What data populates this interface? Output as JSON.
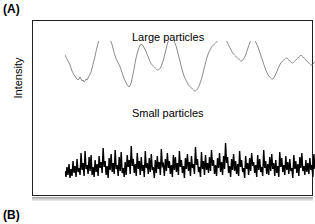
{
  "figure": {
    "panels": [
      {
        "id": "A",
        "label": "(A)"
      },
      {
        "id": "B",
        "label": "(B)"
      }
    ],
    "axis": {
      "ylabel": "Intensity"
    },
    "traces": {
      "large": {
        "label": "Large particles",
        "color": "#6e6e6e"
      },
      "small": {
        "label": "Small particles",
        "color": "#000000"
      }
    },
    "frame": {
      "color": "#231f20"
    }
  },
  "chart_data": {
    "type": "line",
    "title": "",
    "xlabel": "",
    "ylabel": "Intensity",
    "grid": false,
    "legend": "inline-annotation",
    "axis_ticks": {
      "x": [],
      "y": []
    },
    "xlim": [
      0,
      281
    ],
    "ylim": [
      0,
      176
    ],
    "series": [
      {
        "name": "Large particles",
        "color": "#6e6e6e",
        "linewidth": 0.8,
        "baseline_y": 60,
        "description": "Slow quasi-periodic oscillation, four broad maxima",
        "values": [
          46,
          44,
          42,
          40,
          38,
          36,
          33,
          30,
          28,
          26,
          25,
          23,
          22,
          21,
          22,
          24,
          22,
          20,
          21,
          19,
          20,
          22,
          21,
          23,
          25,
          27,
          29,
          33,
          37,
          41,
          45,
          50,
          54,
          58,
          61,
          63,
          62,
          64,
          63,
          65,
          64,
          63,
          62,
          64,
          63,
          61,
          59,
          56,
          52,
          48,
          45,
          42,
          40,
          38,
          36,
          34,
          31,
          28,
          25,
          22,
          20,
          18,
          16,
          15,
          14,
          16,
          18,
          23,
          28,
          33,
          39,
          44,
          48,
          51,
          54,
          56,
          57,
          56,
          55,
          53,
          51,
          49,
          46,
          44,
          41,
          39,
          37,
          36,
          35,
          34,
          33,
          32,
          31,
          31,
          32,
          33,
          35,
          38,
          41,
          45,
          49,
          53,
          57,
          60,
          62,
          63,
          62,
          60,
          61,
          59,
          57,
          54,
          50,
          46,
          42,
          38,
          34,
          30,
          27,
          24,
          22,
          20,
          18,
          16,
          15,
          14,
          13,
          12,
          11,
          10,
          10,
          11,
          12,
          14,
          16,
          19,
          22,
          26,
          30,
          34,
          38,
          42,
          45,
          48,
          50,
          52,
          54,
          55,
          56,
          57,
          58,
          59,
          60,
          62,
          63,
          65,
          66,
          64,
          62,
          63,
          61,
          60,
          58,
          56,
          54,
          52,
          50,
          48,
          47,
          46,
          45,
          44,
          43,
          42,
          41,
          40,
          40,
          41,
          42,
          44,
          46,
          49,
          52,
          55,
          58,
          60,
          62,
          63,
          62,
          61,
          59,
          57,
          55,
          52,
          49,
          46,
          43,
          40,
          37,
          34,
          31,
          29,
          27,
          25,
          24,
          23,
          22,
          22,
          23,
          25,
          27,
          29,
          32,
          34,
          36,
          38,
          39,
          40,
          41,
          42,
          43,
          43,
          42,
          41,
          40,
          39,
          38,
          38,
          39,
          40,
          41,
          42,
          43,
          44,
          45,
          46,
          45,
          44,
          43,
          42,
          41,
          40,
          39,
          38,
          37,
          36,
          36,
          37,
          38,
          39,
          40,
          41,
          42,
          43,
          44,
          45,
          46,
          45,
          44,
          43,
          42,
          41,
          41,
          42,
          43,
          44,
          45,
          46,
          47,
          48,
          49,
          50,
          49,
          48,
          47,
          46,
          45,
          45,
          46,
          47,
          48
        ]
      },
      {
        "name": "Small particles",
        "color": "#000000",
        "linewidth": 1.4,
        "baseline_y": 140,
        "description": "High-frequency noise, rapid spikes of varying amplitude",
        "values": [
          10,
          4,
          14,
          6,
          17,
          3,
          12,
          5,
          20,
          8,
          15,
          4,
          22,
          9,
          13,
          6,
          28,
          11,
          18,
          5,
          30,
          12,
          16,
          7,
          24,
          10,
          26,
          6,
          14,
          4,
          21,
          9,
          17,
          5,
          25,
          13,
          19,
          8,
          33,
          14,
          20,
          6,
          15,
          3,
          23,
          11,
          27,
          9,
          18,
          7,
          31,
          12,
          16,
          5,
          24,
          10,
          29,
          8,
          13,
          4,
          19,
          6,
          26,
          14,
          21,
          7,
          35,
          15,
          22,
          8,
          17,
          5,
          28,
          12,
          20,
          6,
          24,
          10,
          16,
          4,
          30,
          13,
          18,
          7,
          23,
          9,
          27,
          11,
          14,
          3,
          21,
          8,
          25,
          12,
          19,
          6,
          32,
          15,
          17,
          5,
          22,
          10,
          28,
          13,
          20,
          7,
          16,
          4,
          26,
          11,
          24,
          9,
          18,
          6,
          30,
          14,
          21,
          8,
          15,
          3,
          23,
          12,
          27,
          10,
          19,
          5,
          25,
          13,
          17,
          7,
          34,
          16,
          22,
          9,
          14,
          4,
          29,
          12,
          20,
          6,
          26,
          11,
          18,
          8,
          24,
          10,
          31,
          15,
          21,
          7,
          16,
          5,
          23,
          13,
          28,
          9,
          19,
          6,
          25,
          12,
          38,
          18,
          24,
          8,
          15,
          4,
          22,
          11,
          27,
          10,
          20,
          7,
          17,
          5,
          30,
          14,
          21,
          9,
          13,
          3,
          25,
          12,
          18,
          6,
          23,
          10,
          28,
          15,
          19,
          8,
          16,
          4,
          26,
          11,
          22,
          9,
          14,
          5,
          31,
          13,
          20,
          7,
          17,
          6,
          24,
          10,
          27,
          12,
          18,
          5,
          21,
          8,
          15,
          4,
          29,
          14,
          23,
          9,
          16,
          6,
          25,
          11,
          19,
          7,
          22,
          10,
          13,
          3,
          26,
          12,
          20,
          8,
          17,
          5,
          24,
          13,
          28,
          10,
          15,
          6,
          21,
          9,
          18,
          7,
          23,
          11,
          16,
          4,
          27,
          12,
          20,
          8,
          14,
          5,
          22,
          10,
          19,
          6,
          25,
          13,
          17,
          7,
          21,
          9,
          15,
          4,
          23,
          11,
          26,
          12,
          18,
          8,
          20,
          6,
          24,
          10,
          16,
          5,
          22,
          14,
          19
        ]
      }
    ]
  }
}
